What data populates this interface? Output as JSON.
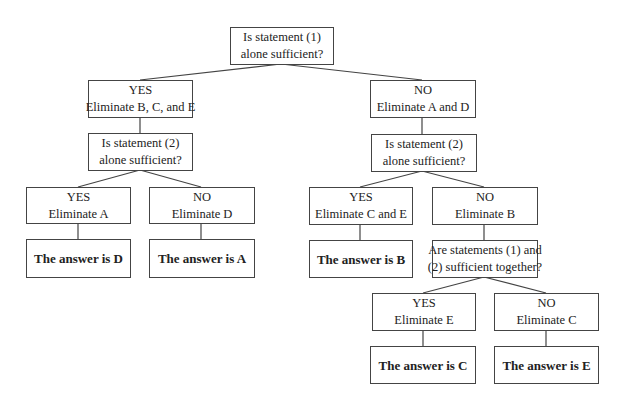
{
  "diagram": {
    "nodes": {
      "root": {
        "lines": [
          "Is statement (1)",
          "alone sufficient?"
        ]
      },
      "yes1": {
        "lines": [
          "YES",
          "Eliminate B, C, and E"
        ]
      },
      "no1": {
        "lines": [
          "NO",
          "Eliminate A and D"
        ]
      },
      "q2_left": {
        "lines": [
          "Is statement (2)",
          "alone sufficient?"
        ]
      },
      "q2_right": {
        "lines": [
          "Is statement (2)",
          "alone sufficient?"
        ]
      },
      "yes_a": {
        "lines": [
          "YES",
          "Eliminate A"
        ]
      },
      "no_d": {
        "lines": [
          "NO",
          "Eliminate D"
        ]
      },
      "ans_d": {
        "lines": [
          "The answer is D"
        ]
      },
      "ans_a": {
        "lines": [
          "The answer is A"
        ]
      },
      "yes_ce": {
        "lines": [
          "YES",
          "Eliminate C and E"
        ]
      },
      "no_b": {
        "lines": [
          "NO",
          "Eliminate B"
        ]
      },
      "ans_b": {
        "lines": [
          "The answer is B"
        ]
      },
      "q3": {
        "lines": [
          "Are statements (1) and",
          "(2) sufficient together?"
        ]
      },
      "yes_e": {
        "lines": [
          "YES",
          "Eliminate E"
        ]
      },
      "no_c": {
        "lines": [
          "NO",
          "Eliminate C"
        ]
      },
      "ans_c": {
        "lines": [
          "The answer is C"
        ]
      },
      "ans_e": {
        "lines": [
          "The answer is E"
        ]
      }
    },
    "colors": {
      "line": "#444444",
      "text": "#222222",
      "background": "#ffffff"
    }
  }
}
